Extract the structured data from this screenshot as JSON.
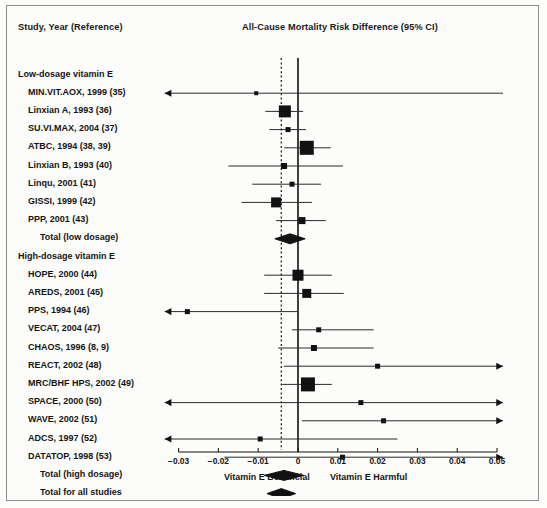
{
  "figure": {
    "column_header": "Study, Year (Reference)",
    "plot_header": "All-Cause Mortality Risk Difference (95% CI)",
    "footer_left": "Vitamin E Beneficial",
    "footer_right": "Vitamin E Harmful",
    "marker_color": "#111111",
    "line_color": "#2b2b2b",
    "frame_color": "#8e8e8e"
  },
  "chart_data": {
    "type": "forest",
    "title": "All-Cause Mortality Risk Difference (95% CI)",
    "xlabel": "Risk Difference",
    "ylabel": "Study, Year (Reference)",
    "xlim": [
      -0.035,
      0.052
    ],
    "ticks": [
      -0.03,
      -0.02,
      -0.01,
      0,
      0.01,
      0.02,
      0.03,
      0.04,
      0.05
    ],
    "tick_labels": [
      "−0.03",
      "−0.02",
      "−0.01",
      "0",
      "0.01",
      "0.02",
      "0.03",
      "0.04",
      "0.05"
    ],
    "null_line": 0,
    "pooled_reference_line": -0.0042,
    "grid": false,
    "legend": null,
    "direction_labels": {
      "left": "Vitamin E Beneficial",
      "right": "Vitamin E Harmful"
    },
    "groups": [
      {
        "label": "Low-dosage vitamin E",
        "studies": [
          {
            "label": "MIN.VIT.AOX, 1999 (35)",
            "estimate": -0.0105,
            "ci_low": -0.0335,
            "ci_high": 0.0515,
            "low_arrow": true,
            "high_arrow": false,
            "marker_size": 4
          },
          {
            "label": "Linxian A, 1993 (36)",
            "estimate": -0.0033,
            "ci_low": -0.0082,
            "ci_high": 0.0013,
            "low_arrow": false,
            "high_arrow": false,
            "marker_size": 12
          },
          {
            "label": "SU.VI.MAX, 2004 (37)",
            "estimate": -0.0025,
            "ci_low": -0.0072,
            "ci_high": 0.002,
            "low_arrow": false,
            "high_arrow": false,
            "marker_size": 5
          },
          {
            "label": "ATBC, 1994 (38, 39)",
            "estimate": 0.0022,
            "ci_low": -0.0035,
            "ci_high": 0.0082,
            "low_arrow": false,
            "high_arrow": false,
            "marker_size": 14
          },
          {
            "label": "Linxian B, 1993 (40)",
            "estimate": -0.0035,
            "ci_low": -0.0175,
            "ci_high": 0.0113,
            "low_arrow": false,
            "high_arrow": false,
            "marker_size": 6
          },
          {
            "label": "Linqu, 2001 (41)",
            "estimate": -0.0015,
            "ci_low": -0.0115,
            "ci_high": 0.0058,
            "low_arrow": false,
            "high_arrow": false,
            "marker_size": 5
          },
          {
            "label": "GISSI, 1999 (42)",
            "estimate": -0.0055,
            "ci_low": -0.0142,
            "ci_high": 0.0035,
            "low_arrow": false,
            "high_arrow": false,
            "marker_size": 10
          },
          {
            "label": "PPP, 2001 (43)",
            "estimate": 0.001,
            "ci_low": -0.0055,
            "ci_high": 0.007,
            "low_arrow": false,
            "high_arrow": false,
            "marker_size": 7
          }
        ],
        "total": {
          "label": "Total (low dosage)",
          "estimate": -0.002,
          "ci_low": -0.0058,
          "ci_high": 0.0018
        }
      },
      {
        "label": "High-dosage vitamin E",
        "studies": [
          {
            "label": "HOPE, 2000 (44)",
            "estimate": 0.0,
            "ci_low": -0.0085,
            "ci_high": 0.0085,
            "low_arrow": false,
            "high_arrow": false,
            "marker_size": 11
          },
          {
            "label": "AREDS, 2001 (45)",
            "estimate": 0.0022,
            "ci_low": -0.0085,
            "ci_high": 0.0115,
            "low_arrow": false,
            "high_arrow": false,
            "marker_size": 9
          },
          {
            "label": "PPS, 1994 (46)",
            "estimate": -0.0278,
            "ci_low": -0.0335,
            "ci_high": -0.0002,
            "low_arrow": true,
            "high_arrow": false,
            "marker_size": 5
          },
          {
            "label": "VECAT, 2004 (47)",
            "estimate": 0.0052,
            "ci_low": -0.0015,
            "ci_high": 0.019,
            "low_arrow": false,
            "high_arrow": false,
            "marker_size": 5
          },
          {
            "label": "CHAOS, 1996 (8, 9)",
            "estimate": 0.004,
            "ci_low": -0.005,
            "ci_high": 0.019,
            "low_arrow": false,
            "high_arrow": false,
            "marker_size": 6
          },
          {
            "label": "REACT, 2002 (48)",
            "estimate": 0.02,
            "ci_low": -0.0035,
            "ci_high": 0.0515,
            "low_arrow": false,
            "high_arrow": true,
            "marker_size": 5
          },
          {
            "label": "MRC/BHF HPS, 2002 (49)",
            "estimate": 0.0025,
            "ci_low": -0.004,
            "ci_high": 0.0085,
            "low_arrow": false,
            "high_arrow": false,
            "marker_size": 14
          },
          {
            "label": "SPACE, 2000 (50)",
            "estimate": 0.0158,
            "ci_low": -0.0335,
            "ci_high": 0.0515,
            "low_arrow": true,
            "high_arrow": true,
            "marker_size": 5
          },
          {
            "label": "WAVE, 2002 (51)",
            "estimate": 0.0215,
            "ci_low": 0.001,
            "ci_high": 0.0515,
            "low_arrow": false,
            "high_arrow": true,
            "marker_size": 5
          },
          {
            "label": "ADCS, 1997 (52)",
            "estimate": -0.0095,
            "ci_low": -0.0335,
            "ci_high": 0.025,
            "low_arrow": true,
            "high_arrow": false,
            "marker_size": 5
          },
          {
            "label": "DATATOP, 1998 (53)",
            "estimate": 0.0112,
            "ci_low": -0.0185,
            "ci_high": 0.0515,
            "low_arrow": false,
            "high_arrow": true,
            "marker_size": 5
          }
        ],
        "total": {
          "label": "Total (high dosage)",
          "estimate": -0.0035,
          "ci_low": -0.0085,
          "ci_high": 0.0015
        }
      }
    ],
    "overall": {
      "label": "Total for all studies",
      "estimate": -0.0042,
      "ci_low": -0.0078,
      "ci_high": -0.0006
    }
  }
}
